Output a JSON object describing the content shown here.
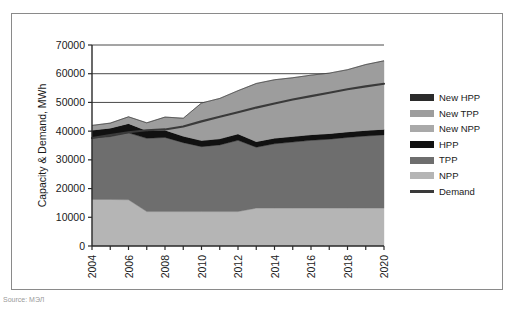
{
  "caption": {
    "text": "Source: МЭЛ"
  },
  "axes": {
    "y_title": "Capacity & Demand, MWh",
    "y_ticks": [
      0,
      10000,
      20000,
      30000,
      40000,
      50000,
      60000,
      70000
    ],
    "x_ticks_labeled": [
      "2004",
      "2006",
      "2008",
      "2010",
      "2012",
      "2014",
      "2016",
      "2018",
      "2020"
    ]
  },
  "legend": {
    "items": [
      {
        "label": "New HPP",
        "color": "#2b2b2b",
        "type": "area"
      },
      {
        "label": "New TPP",
        "color": "#9d9d9d",
        "type": "area"
      },
      {
        "label": "New NPP",
        "color": "#a9a9a9",
        "type": "area"
      },
      {
        "label": "HPP",
        "color": "#111111",
        "type": "area"
      },
      {
        "label": "TPP",
        "color": "#6e6e6e",
        "type": "area"
      },
      {
        "label": "NPP",
        "color": "#b5b5b5",
        "type": "area"
      },
      {
        "label": "Demand",
        "color": "#3a3a3a",
        "type": "line"
      }
    ]
  },
  "chart_data": {
    "type": "area",
    "title": "",
    "xlabel": "",
    "ylabel": "Capacity & Demand, MWh",
    "xlim": [
      2004,
      2020
    ],
    "ylim": [
      0,
      70000
    ],
    "grid": true,
    "legend_position": "right",
    "stacked": true,
    "x": [
      2004,
      2005,
      2006,
      2007,
      2008,
      2009,
      2010,
      2011,
      2012,
      2013,
      2014,
      2015,
      2016,
      2017,
      2018,
      2019,
      2020
    ],
    "series": [
      {
        "name": "NPP",
        "color": "#b5b5b5",
        "values": [
          16200,
          16200,
          16100,
          12000,
          12000,
          12000,
          12000,
          12000,
          12000,
          13200,
          13200,
          13200,
          13200,
          13200,
          13200,
          13200,
          13200
        ]
      },
      {
        "name": "TPP",
        "color": "#6e6e6e",
        "values": [
          21400,
          21900,
          23300,
          25500,
          25800,
          24000,
          22600,
          23200,
          24800,
          21200,
          22400,
          23000,
          23600,
          24000,
          24600,
          25100,
          25500
        ]
      },
      {
        "name": "HPP",
        "color": "#111111",
        "values": [
          2800,
          3000,
          3300,
          2700,
          2600,
          2300,
          2200,
          2200,
          2300,
          2000,
          2000,
          2000,
          2000,
          2000,
          2000,
          2000,
          2000
        ]
      },
      {
        "name": "New NPP",
        "color": "#a9a9a9",
        "values": [
          0,
          0,
          0,
          0,
          0,
          0,
          0,
          0,
          0,
          0,
          0,
          0,
          0,
          0,
          0,
          0,
          0
        ]
      },
      {
        "name": "New TPP",
        "color": "#9d9d9d",
        "values": [
          1600,
          1700,
          2300,
          2700,
          4500,
          6200,
          13000,
          14000,
          15000,
          20200,
          20300,
          20400,
          20700,
          21000,
          21600,
          22900,
          23800
        ]
      },
      {
        "name": "New HPP",
        "color": "#2b2b2b",
        "values": [
          0,
          0,
          0,
          0,
          0,
          0,
          0,
          0,
          0,
          0,
          0,
          0,
          0,
          0,
          0,
          0,
          0
        ]
      }
    ],
    "demand": {
      "name": "Demand",
      "color": "#3a3a3a",
      "values": [
        37600,
        38600,
        39600,
        40300,
        40600,
        41600,
        43400,
        45000,
        46600,
        48200,
        49600,
        51000,
        52200,
        53400,
        54600,
        55600,
        56500
      ]
    }
  }
}
